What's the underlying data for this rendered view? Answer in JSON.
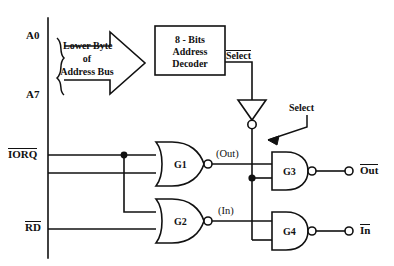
{
  "diagram": {
    "colors": {
      "ink": "#111111",
      "background": "#ffffff"
    },
    "bus": {
      "top_label": "A0",
      "bottom_label": "A7"
    },
    "arrow_block": {
      "line1": "Lower  Byte",
      "line2": "of",
      "line3": "Address  Bus"
    },
    "decoder_box": {
      "line1": "8 - Bits",
      "line2": "Address",
      "line3": "Decoder"
    },
    "labels": {
      "select_bar": "Select",
      "select_plain": "Select",
      "iorq": "IORQ",
      "rd": "RD",
      "out_paren": "(Out)",
      "in_paren": "(In)",
      "out_terminal": "Out",
      "in_terminal": "In"
    },
    "gates": [
      {
        "id": "g1",
        "label": "G1",
        "type": "nor"
      },
      {
        "id": "g2",
        "label": "G2",
        "type": "nor"
      },
      {
        "id": "g3",
        "label": "G3",
        "type": "nand"
      },
      {
        "id": "g4",
        "label": "G4",
        "type": "nand"
      }
    ],
    "inverter": {
      "type": "inverter",
      "orientation": "down"
    }
  }
}
